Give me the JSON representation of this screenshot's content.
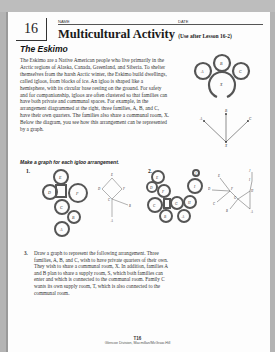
{
  "header": {
    "lesson_number": "16",
    "name_label": "NAME",
    "date_label": "DATE",
    "title": "Multicultural Activity",
    "subtitle": "(Use after Lesson 16-2)"
  },
  "section_title": "The Eskimo",
  "intro_text": "The Eskimo are a Native American people who live primarily in the Arctic regions of Alaska, Canada, Greenland, and Siberia. To shelter themselves from the harsh Arctic winter, the Eskimo build dwellings, called igloos, from blocks of ice. An igloo is shaped like a hemisphere, with its circular base resting on the ground. For safety and for companionship, igloos are often clustered so that families can have both private and communal spaces. For example, in the arrangement diagrammed at the right, three families, A, B, and C, have their own quarters. The families also share a communal room, X. Below the diagram, you see how this arrangement can be represented by a graph.",
  "example": {
    "rooms": [
      "A",
      "B",
      "C",
      "X"
    ],
    "graph_labels": [
      "A",
      "B",
      "C",
      "X"
    ]
  },
  "prompt": "Make a graph for each igloo arrangement.",
  "problem1": {
    "number": "1.",
    "rooms": [
      "E",
      "D",
      "F",
      "C",
      "B",
      "A"
    ],
    "graph_labels": [
      "E",
      "D",
      "F",
      "C",
      "B",
      "A"
    ]
  },
  "problem2": {
    "number": "2.",
    "rooms": [
      "E",
      "D",
      "F",
      "C",
      "G",
      "B",
      "A",
      "H",
      "I",
      "J"
    ],
    "graph_labels": [
      "E",
      "D",
      "F",
      "C",
      "G",
      "B",
      "A",
      "H",
      "I",
      "J"
    ]
  },
  "problem3": {
    "number": "3.",
    "text": "Draw a graph to represent the following arrangement. Three families, A, B, and C, wish to have private quarters of their own. They wish to share a communal room, X. In addition, families A and B plan to share a supply room, S, which both families can enter and which is connected to the communal room. Family C wants its own supply room, T, which is also connected to the communal room."
  },
  "footer": {
    "page": "T16",
    "publisher": "Glencoe Division, Macmillan/McGraw-Hill"
  }
}
